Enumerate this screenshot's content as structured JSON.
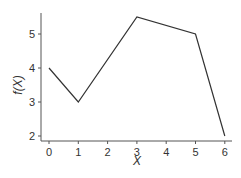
{
  "chart_data": {
    "type": "line",
    "title": "",
    "xlabel": "X",
    "ylabel": "f(X)",
    "x": [
      0,
      1,
      3,
      5,
      6
    ],
    "series": [
      {
        "name": "f(X)",
        "values": [
          4,
          3,
          5.5,
          5,
          2
        ]
      }
    ],
    "xticks": [
      0,
      1,
      2,
      3,
      4,
      5,
      6
    ],
    "yticks": [
      2,
      3,
      4,
      5
    ],
    "xlim": [
      -0.25,
      6.25
    ],
    "ylim": [
      1.85,
      5.65
    ],
    "grid": false,
    "legend": null,
    "line_color": "#333333"
  }
}
